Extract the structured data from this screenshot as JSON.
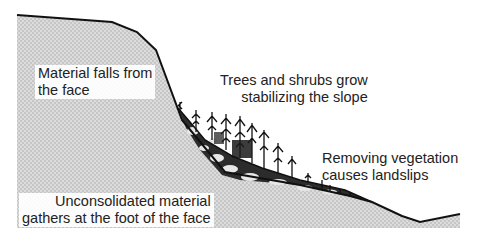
{
  "diagram": {
    "type": "cross-section",
    "colors": {
      "ground_fill": "#d6d6d6",
      "ground_dot": "#bdbdbd",
      "outline": "#111111",
      "debris_fill": "#2a2a2a",
      "boulder_fill": "#e6e6e6",
      "text": "#222222"
    },
    "labels": {
      "face": [
        "Material falls from",
        "the face"
      ],
      "trees": [
        "Trees and shrubs grow",
        "stabilizing the slope"
      ],
      "vegetation": [
        "Removing vegetation",
        "causes landslips"
      ],
      "debris": [
        "Unconsolidated material",
        "gathers at the foot of the face"
      ]
    }
  }
}
